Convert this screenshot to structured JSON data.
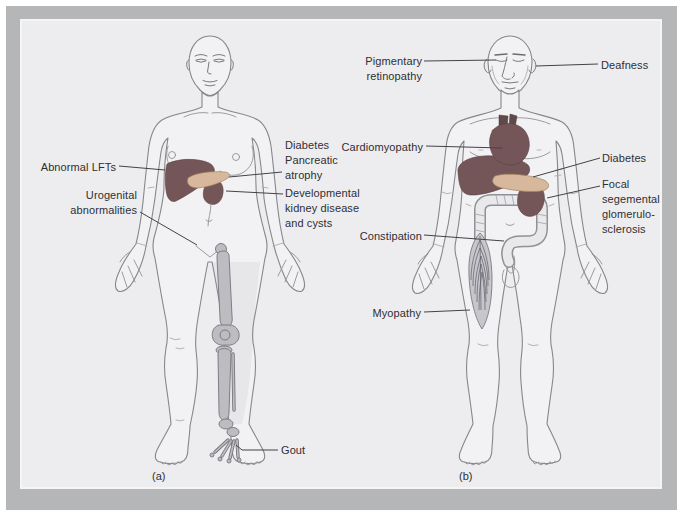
{
  "panel_a": {
    "caption": "(a)",
    "labels": {
      "abnormal_lfts": "Abnormal LFTs",
      "urogenital": "Urogenital abnormalities",
      "diabetes_pancreatic_atrophy": "Diabetes Pancreatic atrophy",
      "developmental_kidney": "Developmental kidney disease and cysts",
      "gout": "Gout"
    }
  },
  "panel_b": {
    "caption": "(b)",
    "labels": {
      "pigmentary_retinopathy": "Pigmentary retinopathy",
      "deafness": "Deafness",
      "cardiomyopathy": "Cardiomyopathy",
      "diabetes": "Diabetes",
      "focal_segmental": "Focal segemental glomerulo-sclerosis",
      "constipation": "Constipation",
      "myopathy": "Myopathy"
    }
  },
  "colors": {
    "frame": "#b5b6b8",
    "panel_bg": "#ededef",
    "text": "#2f2f33",
    "leader": "#434347",
    "organ_dark": "#745659",
    "heart_light": "#bd998a",
    "vessel": "#5f494b",
    "pancreas": "#d8b89c",
    "bone": "#bcbcc1",
    "body_fill": "#f2f2f4",
    "outline": "#85878a"
  }
}
